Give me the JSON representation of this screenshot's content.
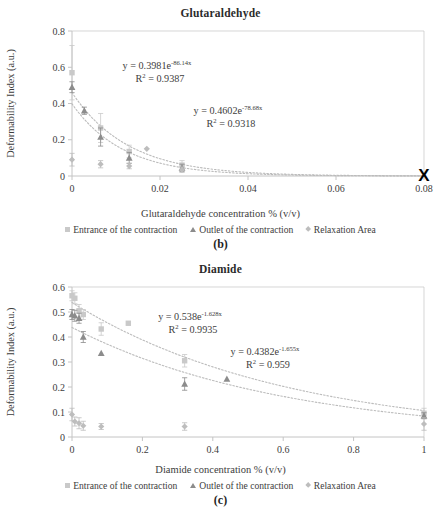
{
  "figure": {
    "panels": [
      {
        "id": "b",
        "caption": "(b)",
        "title": "Glutaraldehyde",
        "xlabel": "Glutaraldehyde concentration % (v/v)",
        "ylabel": "Deformability Index (a.u.)",
        "annotations": [
          {
            "line1_a": "y = 0.3981e",
            "line1_sup": "-86.14x",
            "line2_a": "R",
            "line2_sup": "2",
            "line2_b": " = 0.9387"
          },
          {
            "line1_a": "y = 0.4602e",
            "line1_sup": "-78.68x",
            "line2_a": "R",
            "line2_sup": "2",
            "line2_b": " = 0.9318"
          }
        ]
      },
      {
        "id": "c",
        "caption": "(c)",
        "title": "Diamide",
        "xlabel": "Diamide concentration % (v/v)",
        "ylabel": "Deformability Index (a.u.)",
        "annotations": [
          {
            "line1_a": "y = 0.538e",
            "line1_sup": "-1.628x",
            "line2_a": "R",
            "line2_sup": "2",
            "line2_b": " = 0.9935"
          },
          {
            "line1_a": "y = 0.4382e",
            "line1_sup": "-1.655x",
            "line2_a": "R",
            "line2_sup": "2",
            "line2_b": " = 0.959"
          }
        ]
      }
    ],
    "legend": {
      "entrance_label": "Entrance of the contraction",
      "outlet_label": "Outlet of the contraction",
      "relaxation_label": "Relaxation Area"
    },
    "colors": {
      "entrance": "#c9c9c9",
      "outlet": "#8c8c8c",
      "relaxation": "#bdbdbd",
      "trend": "#bcbcbc",
      "axis": "#c4c4c4",
      "marker_x": "#000000"
    }
  },
  "chart_data": [
    {
      "type": "scatter",
      "title": "Glutaraldehyde",
      "xlabel": "Glutaraldehyde concentration % (v/v)",
      "ylabel": "Deformability Index (a.u.)",
      "xlim": [
        0,
        0.08
      ],
      "ylim": [
        0,
        0.8
      ],
      "xticks": [
        "0",
        "0.02",
        "0.04",
        "0.06",
        "0.08"
      ],
      "xtick_values": [
        0,
        0.02,
        0.04,
        0.06,
        0.08
      ],
      "yticks": [
        "0",
        "0.2",
        "0.4",
        "0.6",
        "0.8"
      ],
      "ytick_values": [
        0,
        0.2,
        0.4,
        0.6,
        0.8
      ],
      "grid": false,
      "legend_position": "bottom",
      "series": [
        {
          "name": "Entrance of the contraction",
          "marker": "square",
          "color": "#c9c9c9",
          "x": [
            0,
            0.0065,
            0.013,
            0.025
          ],
          "y": [
            0.57,
            0.265,
            0.135,
            0.06
          ],
          "yerr": [
            0.15,
            0.08,
            0.035,
            0.025
          ]
        },
        {
          "name": "Outlet of the contraction",
          "marker": "triangle",
          "color": "#8c8c8c",
          "x": [
            0,
            0.0028,
            0.0065,
            0.013,
            0.025
          ],
          "y": [
            0.49,
            0.36,
            0.215,
            0.1,
            0.045
          ],
          "yerr": [
            0.03,
            0.02,
            0.05,
            0.03,
            0.02
          ]
        },
        {
          "name": "Relaxation Area",
          "marker": "diamond",
          "color": "#bdbdbd",
          "x": [
            0,
            0.0065,
            0.013,
            0.017,
            0.025
          ],
          "y": [
            0.09,
            0.065,
            0.055,
            0.15,
            0.035
          ],
          "yerr": [
            0.035,
            0.02,
            0.015,
            0.0,
            0.015
          ]
        }
      ],
      "trendlines": [
        {
          "label": "y = 0.3981e^-86.14x",
          "a": 0.3981,
          "b": -86.14,
          "r2": 0.9387
        },
        {
          "label": "y = 0.4602e^-78.68x",
          "a": 0.4602,
          "b": -78.68,
          "r2": 0.9318
        }
      ],
      "special_markers": [
        {
          "name": "bold-x-marker",
          "x": 0.08,
          "y": 0.0,
          "symbol": "X"
        }
      ]
    },
    {
      "type": "scatter",
      "title": "Diamide",
      "xlabel": "Diamide concentration % (v/v)",
      "ylabel": "Deformability Index (a.u.)",
      "xlim": [
        0,
        1
      ],
      "ylim": [
        0,
        0.6
      ],
      "xticks": [
        "0",
        "0.2",
        "0.4",
        "0.6",
        "0.8",
        "1"
      ],
      "xtick_values": [
        0,
        0.2,
        0.4,
        0.6,
        0.8,
        1
      ],
      "yticks": [
        "0",
        "0.1",
        "0.2",
        "0.3",
        "0.4",
        "0.5",
        "0.6"
      ],
      "ytick_values": [
        0,
        0.1,
        0.2,
        0.3,
        0.4,
        0.5,
        0.6
      ],
      "grid": false,
      "legend_position": "bottom",
      "series": [
        {
          "name": "Entrance of the contraction",
          "marker": "square",
          "color": "#c9c9c9",
          "x": [
            0,
            0.008,
            0.02,
            0.032,
            0.083,
            0.16,
            0.32,
            1.0
          ],
          "y": [
            0.565,
            0.555,
            0.505,
            0.49,
            0.432,
            0.455,
            0.305,
            0.095
          ],
          "yerr": [
            0.02,
            0.022,
            0.025,
            0.02,
            0.025,
            0.0,
            0.025,
            0.02
          ]
        },
        {
          "name": "Outlet of the contraction",
          "marker": "triangle",
          "color": "#8c8c8c",
          "x": [
            0,
            0.008,
            0.02,
            0.032,
            0.083,
            0.32,
            0.44,
            1.0
          ],
          "y": [
            0.49,
            0.485,
            0.475,
            0.4,
            0.335,
            0.212,
            0.232,
            0.085
          ],
          "yerr": [
            0.02,
            0.022,
            0.02,
            0.022,
            0.0,
            0.025,
            0.0,
            0.012
          ]
        },
        {
          "name": "Relaxation Area",
          "marker": "diamond",
          "color": "#bdbdbd",
          "x": [
            0,
            0.008,
            0.02,
            0.032,
            0.083,
            0.32,
            1.0
          ],
          "y": [
            0.09,
            0.062,
            0.055,
            0.045,
            0.042,
            0.042,
            0.052
          ],
          "yerr": [
            0.025,
            0.018,
            0.022,
            0.018,
            0.012,
            0.015,
            0.025
          ]
        }
      ],
      "trendlines": [
        {
          "label": "y = 0.538e^-1.628x",
          "a": 0.538,
          "b": -1.628,
          "r2": 0.9935
        },
        {
          "label": "y = 0.4382e^-1.655x",
          "a": 0.4382,
          "b": -1.655,
          "r2": 0.959
        }
      ],
      "special_markers": []
    }
  ]
}
